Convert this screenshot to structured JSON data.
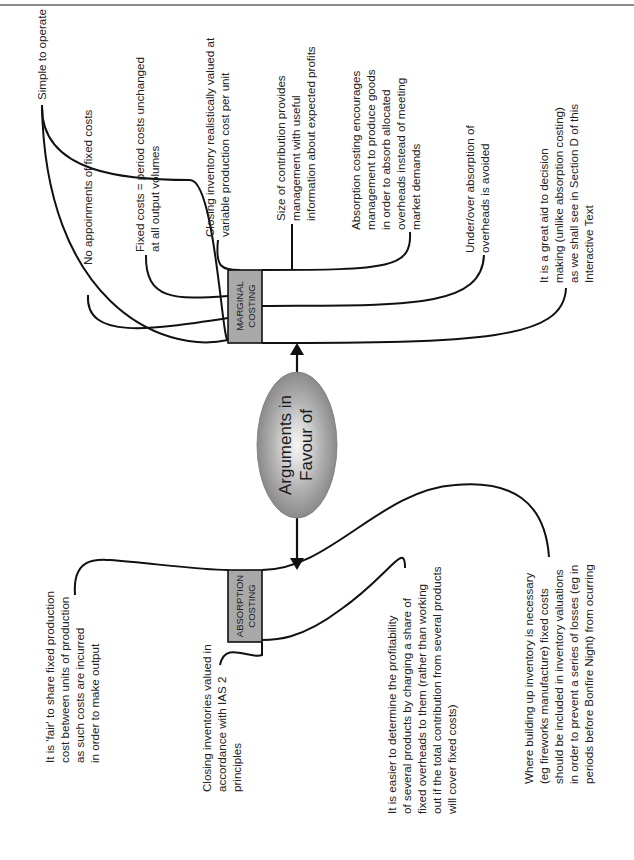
{
  "page": {
    "header_rule": true
  },
  "diagram": {
    "title": "Arguments in Favour of",
    "center": {
      "label_lines": [
        "Arguments in",
        "Favour of"
      ],
      "fill_outer": "#8f8f8f",
      "fill_inner": "#f4f4f4"
    },
    "marginal": {
      "label_lines": [
        "MARGINAL",
        "COSTING"
      ],
      "box_fill": "#a9a9a9",
      "arguments": [
        {
          "lines": [
            "Simple to operate"
          ]
        },
        {
          "lines": [
            "No appoinments of fixed costs"
          ]
        },
        {
          "lines": [
            "Fixed costs = period costs unchanged",
            "at all output volumes"
          ]
        },
        {
          "lines": [
            "Closing inventory realistically valued at",
            "variable production cost per unit"
          ]
        },
        {
          "lines": [
            "Size of contribution provides",
            "management with useful",
            "information about expected profits"
          ]
        },
        {
          "lines": [
            "Absorption costing encourages",
            "management to produce goods",
            "in order to absorb allocated",
            "overheads instead of meeting",
            "market demands"
          ]
        },
        {
          "lines": [
            "Under/over absorption of",
            "overheads is avoided"
          ]
        },
        {
          "lines": [
            "It is a great aid to decision",
            "making (unlike absorption costing)",
            "as we shall see in Section D of this",
            "Interactive Text"
          ]
        }
      ]
    },
    "absorption": {
      "label_lines": [
        "ABSORPTION",
        "COSTING"
      ],
      "box_fill": "#a9a9a9",
      "arguments": [
        {
          "lines": [
            "It is 'fair' to share fixed production",
            "cost between units of production",
            "as such costs are incurred",
            "in order to make output"
          ]
        },
        {
          "lines": [
            "Closing inventories valued in",
            "accordance with IAS 2",
            "principles"
          ]
        },
        {
          "lines": [
            "It is easier to determine the profitability",
            "of several products by charging a share of",
            "fixed overheads to them (rather than working",
            "out if the total contribution from several products",
            "will cover fixed costs)"
          ]
        },
        {
          "lines": [
            "Where building up inventory is necessary",
            "(eg fireworks manufacture) fixed costs",
            "should be included in inventory valuations",
            "in order to prevent a series of losses (eg in",
            "periods before Bonfire Night) from ocurring"
          ]
        }
      ]
    }
  }
}
